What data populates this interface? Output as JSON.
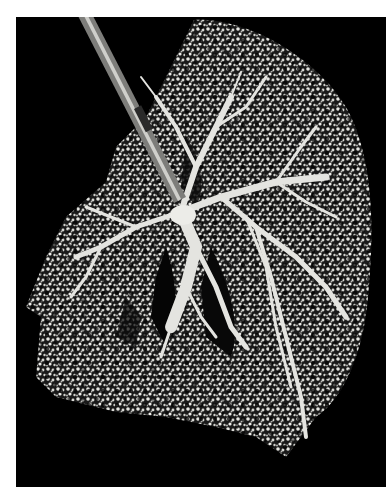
{
  "image": {
    "subject": "Lung cast showing bronchial tree",
    "alt": "Black and white photograph of a resin cast of a lung's bronchial tree against a black background, with an insertion tube at the upper left",
    "colors": {
      "background": "#000000",
      "page": "#ffffff",
      "cast": "#e8e8e4",
      "cast_shadow": "#9a9a96"
    }
  }
}
